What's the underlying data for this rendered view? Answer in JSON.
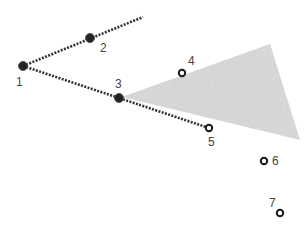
{
  "diagram": {
    "colors": {
      "line": "#333333",
      "filled_point": "#222222",
      "open_point_stroke": "#1a1a1a",
      "region_fill": "#dcdcdc",
      "label": "#444444"
    },
    "region": {
      "points": "122,97 270,44 300,140"
    },
    "segments": [
      {
        "x1": 23,
        "y1": 66,
        "x2": 143,
        "y2": 17
      },
      {
        "x1": 23,
        "y1": 66,
        "x2": 209,
        "y2": 128
      }
    ],
    "points": [
      {
        "id": "1",
        "x": 23,
        "y": 66,
        "filled": true,
        "lx": 16,
        "ly": 86
      },
      {
        "id": "2",
        "x": 90,
        "y": 38,
        "filled": true,
        "lx": 100,
        "ly": 52
      },
      {
        "id": "3",
        "x": 119,
        "y": 98,
        "filled": true,
        "lx": 115,
        "ly": 88
      },
      {
        "id": "4",
        "x": 182,
        "y": 73,
        "filled": false,
        "lx": 188,
        "ly": 65
      },
      {
        "id": "5",
        "x": 209,
        "y": 128,
        "filled": false,
        "lx": 208,
        "ly": 146
      },
      {
        "id": "6",
        "x": 264,
        "y": 161,
        "filled": false,
        "lx": 272,
        "ly": 165
      },
      {
        "id": "7",
        "x": 280,
        "y": 213,
        "filled": false,
        "lx": 269,
        "ly": 207
      }
    ]
  }
}
